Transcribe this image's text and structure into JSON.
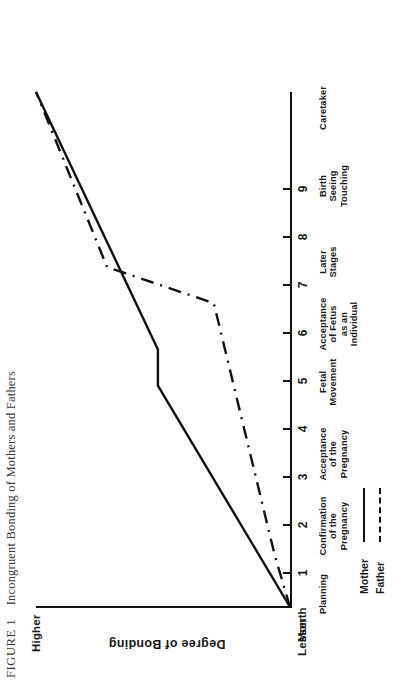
{
  "caption": {
    "number": "FIGURE 1",
    "text": "Incongruent Bonding of Mothers and Fathers"
  },
  "axes": {
    "y_title": "Degree of Bonding",
    "y_high": "Higher",
    "y_low": "Lesser",
    "x_prefix": "Month"
  },
  "legend": {
    "items": [
      {
        "label": "Mother",
        "style": "solid"
      },
      {
        "label": "Father",
        "style": "dash-dot"
      }
    ]
  },
  "chart_data": {
    "type": "line",
    "title": "Incongruent Bonding of Mothers and Fathers",
    "xlabel": "Month",
    "ylabel": "Degree of Bonding",
    "ylim": [
      0,
      100
    ],
    "ytick_labels": [
      "Lesser",
      "Higher"
    ],
    "grid": false,
    "legend_position": "bottom-left",
    "x": [
      0,
      1,
      2,
      3,
      4,
      5,
      6,
      7,
      8,
      9,
      10
    ],
    "xtick_labels": [
      "Month",
      "1",
      "2",
      "3",
      "4",
      "5",
      "6",
      "7",
      "8",
      "9",
      ""
    ],
    "stage_labels": [
      "Planning",
      "Confirmation of the Pregnancy",
      "Acceptance of the Pregnancy",
      "Fetal Movement",
      "Acceptance of Fetus as an Individual",
      "Later Stages",
      "Birth Seeing Touching",
      "Caretaker"
    ],
    "series": [
      {
        "name": "Mother",
        "style": "solid",
        "x": [
          0,
          4.3,
          5.0,
          10
        ],
        "values": [
          0,
          52,
          52,
          100
        ]
      },
      {
        "name": "Father",
        "style": "dash-dot",
        "x": [
          0,
          1.0,
          5.9,
          6.6,
          10
        ],
        "values": [
          0,
          6,
          30,
          72,
          100
        ]
      }
    ]
  },
  "ticks": [
    {
      "label": "1",
      "x": 112
    },
    {
      "label": "2",
      "x": 160
    },
    {
      "label": "3",
      "x": 208
    },
    {
      "label": "4",
      "x": 256
    },
    {
      "label": "5",
      "x": 304
    },
    {
      "label": "6",
      "x": 352
    },
    {
      "label": "7",
      "x": 400
    },
    {
      "label": "8",
      "x": 448
    },
    {
      "label": "9",
      "x": 496
    }
  ],
  "stages": [
    {
      "text": "Planning",
      "x": 92,
      "lines": [
        "Planning"
      ]
    },
    {
      "text": "Confirmation of the Pregnancy",
      "x": 160,
      "lines": [
        "Confirmation",
        "of the",
        "Pregnancy"
      ]
    },
    {
      "text": "Acceptance of the Pregnancy",
      "x": 232,
      "lines": [
        "Acceptance",
        "of the",
        "Pregnancy"
      ]
    },
    {
      "text": "Fetal Movement",
      "x": 304,
      "lines": [
        "Fetal",
        "Movement"
      ]
    },
    {
      "text": "Acceptance of Fetus as an Individual",
      "x": 362,
      "lines": [
        "Acceptance",
        "of Fetus",
        "as an",
        "Individual"
      ]
    },
    {
      "text": "Later Stages",
      "x": 424,
      "lines": [
        "Later",
        "Stages"
      ]
    },
    {
      "text": "Birth Seeing Touching",
      "x": 500,
      "lines": [
        "Birth",
        "Seeing",
        "Touching"
      ]
    },
    {
      "text": "Caretaker",
      "x": 578,
      "lines": [
        "Caretaker"
      ]
    }
  ]
}
